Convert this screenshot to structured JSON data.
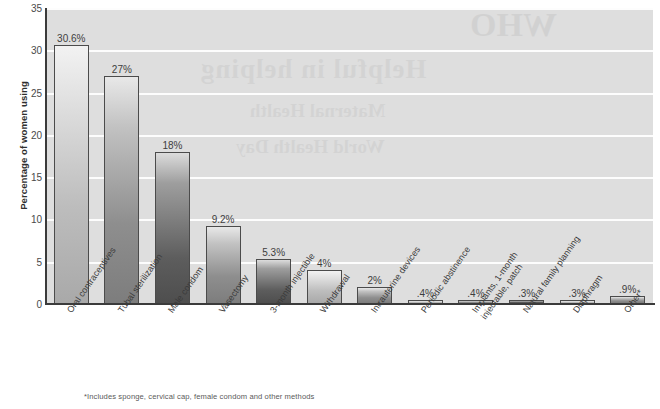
{
  "chart_data": {
    "type": "bar",
    "title": "",
    "xlabel": "",
    "ylabel": "Percentage of women using",
    "ylim": [
      0,
      35
    ],
    "yticks": [
      "0",
      "5",
      "10",
      "15",
      "20",
      "25",
      "30",
      "35"
    ],
    "grid": true,
    "legend": "none",
    "categories": [
      "Oral contraceptives",
      "Tubal sterilization",
      "Male condom",
      "Vasectomy",
      "3-month injectible",
      "Withdrawal",
      "Intrauterine devices",
      "Periodic abstinence",
      "Implants, 1-month\ninjectable, patch",
      "Natural family planning",
      "Diaphragm",
      "Other*"
    ],
    "values": [
      30.6,
      27,
      18,
      9.2,
      5.3,
      4,
      2,
      0.4,
      0.4,
      0.3,
      0.3,
      0.9
    ],
    "value_labels": [
      "30.6%",
      "27%",
      "18%",
      "9.2%",
      "5.3%",
      "4%",
      "2%",
      ".4%",
      ".4%",
      ".3%",
      ".3%",
      ".9%"
    ],
    "bar_tones": [
      "light",
      "mid",
      "dark",
      "mid",
      "dark",
      "light",
      "mid",
      "light",
      "mid",
      "dark",
      "light",
      "mid"
    ],
    "annotations": [
      "*Includes sponge, cervical cap, female condom and other methods"
    ]
  },
  "footnote": "*Includes sponge, cervical cap, female condom and other methods",
  "colors": {
    "plot_background": "#dedede",
    "gridline": "#fdfdfd",
    "axis": "#3b3b3b",
    "text": "#3a3a3a"
  },
  "watermark": {
    "line1": "Helpful in helping",
    "line2": "Maternal Health",
    "line3": "World Health Day",
    "corner": "WHO"
  }
}
